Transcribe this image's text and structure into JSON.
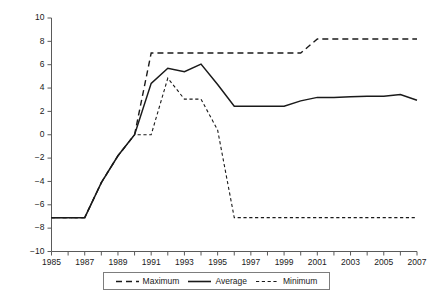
{
  "chart_data": {
    "type": "line",
    "title": "",
    "subtitle": "",
    "xlabel": "",
    "ylabel": "",
    "xlim": [
      1985,
      2007
    ],
    "ylim": [
      -10,
      10
    ],
    "grid": false,
    "legend_position": "bottom-center",
    "x": [
      1985,
      1986,
      1987,
      1988,
      1989,
      1990,
      1991,
      1992,
      1993,
      1994,
      1995,
      1996,
      1997,
      1998,
      1999,
      2000,
      2001,
      2002,
      2003,
      2004,
      2005,
      2006,
      2007
    ],
    "xtick_labels": [
      "1985",
      "1987",
      "1989",
      "1991",
      "1993",
      "1995",
      "1997",
      "1999",
      "2001",
      "2003",
      "2005",
      "2007"
    ],
    "xtick_values": [
      1985,
      1987,
      1989,
      1991,
      1993,
      1995,
      1997,
      1999,
      2001,
      2003,
      2005,
      2007
    ],
    "xtick_minor_values": [
      1986,
      1988,
      1990,
      1992,
      1994,
      1996,
      1998,
      2000,
      2002,
      2004,
      2006
    ],
    "ytick_labels": [
      "10",
      "8",
      "6",
      "4",
      "2",
      "0",
      "-2",
      "-4",
      "-6",
      "-8",
      "-10"
    ],
    "ytick_values": [
      10,
      8,
      6,
      4,
      2,
      0,
      -2,
      -4,
      -6,
      -8,
      -10
    ],
    "series": [
      {
        "name": "Maximum",
        "style": "long-dashed",
        "color": "#1a1a1a",
        "values": [
          -7.1,
          -7.1,
          -7.1,
          -4.1,
          -1.8,
          0.0,
          7.0,
          7.0,
          7.0,
          7.0,
          7.0,
          7.0,
          7.0,
          7.0,
          7.0,
          7.0,
          8.2,
          8.2,
          8.2,
          8.2,
          8.2,
          8.2,
          8.2
        ]
      },
      {
        "name": "Average",
        "style": "solid",
        "color": "#1a1a1a",
        "values": [
          -7.1,
          -7.1,
          -7.1,
          -4.1,
          -1.8,
          0.0,
          4.4,
          5.7,
          5.4,
          6.05,
          4.3,
          2.45,
          2.45,
          2.45,
          2.45,
          2.9,
          3.2,
          3.2,
          3.25,
          3.3,
          3.3,
          3.45,
          2.95
        ]
      },
      {
        "name": "Minimum",
        "style": "short-dashed",
        "color": "#1a1a1a",
        "values": [
          -7.1,
          -7.1,
          -7.1,
          -4.1,
          -1.8,
          0.0,
          0.0,
          4.85,
          3.05,
          3.05,
          0.4,
          -7.1,
          -7.1,
          -7.1,
          -7.1,
          -7.1,
          -7.1,
          -7.1,
          -7.1,
          -7.1,
          -7.1,
          -7.1,
          -7.1
        ]
      }
    ],
    "legend": [
      {
        "label": "Maximum",
        "style": "long-dashed"
      },
      {
        "label": "Average",
        "style": "solid"
      },
      {
        "label": "Minimum",
        "style": "short-dashed"
      }
    ]
  },
  "axis_color": "#5a5a5a",
  "line_color": "#1a1a1a",
  "background_color": "#ffffff"
}
